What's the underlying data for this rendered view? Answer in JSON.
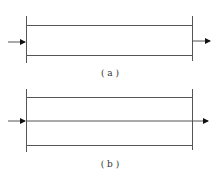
{
  "panels": [
    {
      "id": "a",
      "caption": "( a )",
      "description": "Flow through pipe: inlet arrow and outlet arrow at ends"
    },
    {
      "id": "b",
      "caption": "( b )",
      "description": "Flow through pipe with continuous central streamline"
    }
  ],
  "colors": {
    "line": "#555555",
    "arrow": "#111111",
    "background": "#ffffff"
  }
}
